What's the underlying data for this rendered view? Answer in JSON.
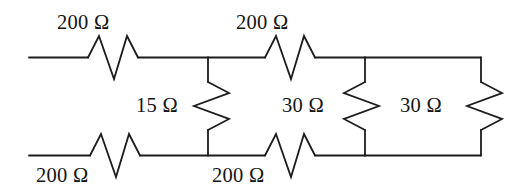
{
  "figure": {
    "kind": "electrical-circuit-schematic",
    "stroke_color": "#1c1c1c",
    "background_color": "#ffffff",
    "text_color": "#141414"
  },
  "labels": {
    "top_left_resistor": "200 Ω",
    "top_middle_resistor": "200 Ω",
    "bottom_left_resistor": "200 Ω",
    "bottom_middle_resistor": "200 Ω",
    "shunt_first": "15 Ω",
    "shunt_second": "30 Ω",
    "shunt_third": "30 Ω"
  },
  "components": [
    {
      "name": "top-left-resistor",
      "value": "200 Ω",
      "orientation": "horizontal",
      "branch": "top-rail"
    },
    {
      "name": "top-middle-resistor",
      "value": "200 Ω",
      "orientation": "horizontal",
      "branch": "top-rail"
    },
    {
      "name": "bottom-left-resistor",
      "value": "200 Ω",
      "orientation": "horizontal",
      "branch": "bottom-rail"
    },
    {
      "name": "bottom-middle-resistor",
      "value": "200 Ω",
      "orientation": "horizontal",
      "branch": "bottom-rail"
    },
    {
      "name": "first-shunt-resistor",
      "value": "15 Ω",
      "orientation": "vertical",
      "branch": "shunt-1"
    },
    {
      "name": "second-shunt-resistor",
      "value": "30 Ω",
      "orientation": "vertical",
      "branch": "shunt-2"
    },
    {
      "name": "third-shunt-resistor",
      "value": "30 Ω",
      "orientation": "vertical",
      "branch": "shunt-3"
    }
  ]
}
